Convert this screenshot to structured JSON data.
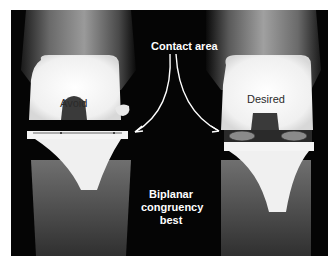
{
  "figure": {
    "annotations": {
      "contact_area": "Contact area",
      "left_label": "Avoid",
      "right_label": "Desired",
      "bottom_note_line1": "Biplanar",
      "bottom_note_line2": "congruency",
      "bottom_note_line3": "best"
    },
    "colors": {
      "background": "#050505",
      "implant": "#f2f2f2",
      "contact_ellipse": "#8a8a8a",
      "arrow": "#ffffff"
    }
  }
}
